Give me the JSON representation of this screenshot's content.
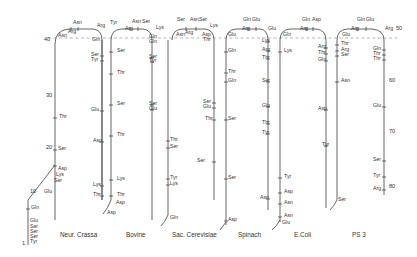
{
  "figure": {
    "reference_line": "dashed"
  },
  "residue_numbers": [
    {
      "label": "1",
      "x": 22,
      "y": 245
    },
    {
      "label": "10",
      "x": 30,
      "y": 193
    },
    {
      "label": "20",
      "x": 46,
      "y": 149
    },
    {
      "label": "30",
      "x": 46,
      "y": 97
    },
    {
      "label": "40",
      "x": 44,
      "y": 41
    },
    {
      "label": "50",
      "x": 396,
      "y": 30
    },
    {
      "label": "60",
      "x": 389,
      "y": 82
    },
    {
      "label": "70",
      "x": 389,
      "y": 133
    },
    {
      "label": "80",
      "x": 389,
      "y": 188
    }
  ],
  "organisms": [
    {
      "name": "Neur. Crassa",
      "caption_x": 60,
      "caption_y": 237
    },
    {
      "name": "Bovine",
      "caption_x": 126,
      "caption_y": 237
    },
    {
      "name": "Sac. Cerevisiae",
      "caption_x": 172,
      "caption_y": 237
    },
    {
      "name": "Spinach",
      "caption_x": 238,
      "caption_y": 237
    },
    {
      "name": "E.Coli",
      "caption_x": 294,
      "caption_y": 237
    },
    {
      "name": "PS 3",
      "caption_x": 352,
      "caption_y": 237
    }
  ],
  "labels": {
    "neur": [
      {
        "t": "Asn",
        "x": 73,
        "y": 24
      },
      {
        "t": "Arg",
        "x": 68,
        "y": 33
      },
      {
        "t": "Arg",
        "x": 97,
        "y": 27
      },
      {
        "t": "Asn",
        "x": 58,
        "y": 37
      },
      {
        "t": "Gln",
        "x": 92,
        "y": 41
      },
      {
        "t": "Ser",
        "x": 91,
        "y": 56
      },
      {
        "t": "Tyr",
        "x": 91,
        "y": 61
      },
      {
        "t": "Thr",
        "x": 59,
        "y": 118
      },
      {
        "t": "Glu",
        "x": 91,
        "y": 111
      },
      {
        "t": "Ser",
        "x": 58,
        "y": 150
      },
      {
        "t": "Asp",
        "x": 58,
        "y": 170
      },
      {
        "t": "Lys",
        "x": 56,
        "y": 176
      },
      {
        "t": "Ser",
        "x": 54,
        "y": 182
      },
      {
        "t": "Glu",
        "x": 44,
        "y": 193
      },
      {
        "t": "Gln",
        "x": 31,
        "y": 209
      },
      {
        "t": "Glu",
        "x": 30,
        "y": 222
      },
      {
        "t": "Ser",
        "x": 30,
        "y": 228
      },
      {
        "t": "Ser",
        "x": 30,
        "y": 233
      },
      {
        "t": "Ser",
        "x": 30,
        "y": 238
      },
      {
        "t": "Tyr",
        "x": 30,
        "y": 243
      }
    ],
    "bovine": [
      {
        "t": "Tyr",
        "x": 110,
        "y": 24
      },
      {
        "t": "Arg",
        "x": 125,
        "y": 30
      },
      {
        "t": "Asn",
        "x": 132,
        "y": 23
      },
      {
        "t": "Ser",
        "x": 142,
        "y": 23
      },
      {
        "t": "Ser",
        "x": 117,
        "y": 52
      },
      {
        "t": "Thr",
        "x": 117,
        "y": 74
      },
      {
        "t": "Ser",
        "x": 117,
        "y": 105
      },
      {
        "t": "Asp",
        "x": 93,
        "y": 142
      },
      {
        "t": "Thr",
        "x": 117,
        "y": 136
      },
      {
        "t": "Lys",
        "x": 93,
        "y": 186
      },
      {
        "t": "Lys",
        "x": 117,
        "y": 180
      },
      {
        "t": "Thr",
        "x": 93,
        "y": 196
      },
      {
        "t": "Thr",
        "x": 117,
        "y": 196
      },
      {
        "t": "Asp",
        "x": 116,
        "y": 204
      },
      {
        "t": "Asp",
        "x": 107,
        "y": 214
      }
    ],
    "sac": [
      {
        "t": "Lys",
        "x": 156,
        "y": 29
      },
      {
        "t": "Gln",
        "x": 149,
        "y": 38
      },
      {
        "t": "Gln",
        "x": 149,
        "y": 43
      },
      {
        "t": "Ser",
        "x": 149,
        "y": 58
      },
      {
        "t": "Tyr",
        "x": 149,
        "y": 62
      },
      {
        "t": "Ser",
        "x": 149,
        "y": 105
      },
      {
        "t": "Glu",
        "x": 149,
        "y": 110
      },
      {
        "t": "Thr",
        "x": 170,
        "y": 141
      },
      {
        "t": "Ser",
        "x": 170,
        "y": 148
      },
      {
        "t": "Tyr",
        "x": 170,
        "y": 179
      },
      {
        "t": "Lys",
        "x": 170,
        "y": 185
      },
      {
        "t": "Gln",
        "x": 170,
        "y": 219
      }
    ],
    "spinach": [
      {
        "t": "Ser",
        "x": 177,
        "y": 21
      },
      {
        "t": "Asn",
        "x": 190,
        "y": 21
      },
      {
        "t": "Ser",
        "x": 199,
        "y": 21
      },
      {
        "t": "Lys",
        "x": 210,
        "y": 27
      },
      {
        "t": "Asn",
        "x": 176,
        "y": 36
      },
      {
        "t": "Arg",
        "x": 185,
        "y": 34
      },
      {
        "t": "Asp",
        "x": 202,
        "y": 36
      },
      {
        "t": "Thr",
        "x": 203,
        "y": 41
      },
      {
        "t": "Ser",
        "x": 203,
        "y": 103
      },
      {
        "t": "Glu",
        "x": 203,
        "y": 108
      },
      {
        "t": "Thr",
        "x": 205,
        "y": 120
      },
      {
        "t": "Ser",
        "x": 197,
        "y": 162
      }
    ],
    "spinach_b": [
      {
        "t": "Gln",
        "x": 228,
        "y": 52
      },
      {
        "t": "Thr",
        "x": 228,
        "y": 73
      },
      {
        "t": "Gln",
        "x": 228,
        "y": 82
      },
      {
        "t": "Ser",
        "x": 228,
        "y": 120
      },
      {
        "t": "Ser",
        "x": 228,
        "y": 179
      },
      {
        "t": "Asp",
        "x": 228,
        "y": 221
      }
    ],
    "ecoli_a": [
      {
        "t": "Gln",
        "x": 243,
        "y": 21
      },
      {
        "t": "Glu",
        "x": 252,
        "y": 21
      },
      {
        "t": "Arg",
        "x": 242,
        "y": 30
      },
      {
        "t": "Glu",
        "x": 228,
        "y": 36
      },
      {
        "t": "Glu",
        "x": 268,
        "y": 30
      },
      {
        "t": "Lys",
        "x": 262,
        "y": 42
      },
      {
        "t": "Arg",
        "x": 262,
        "y": 51
      },
      {
        "t": "Thr",
        "x": 262,
        "y": 59
      },
      {
        "t": "Ser",
        "x": 262,
        "y": 82
      },
      {
        "t": "Glu",
        "x": 262,
        "y": 107
      },
      {
        "t": "Thr",
        "x": 262,
        "y": 124
      },
      {
        "t": "Tyr",
        "x": 262,
        "y": 134
      },
      {
        "t": "Asn",
        "x": 260,
        "y": 199
      }
    ],
    "ecoli_b": [
      {
        "t": "Gln",
        "x": 302,
        "y": 21
      },
      {
        "t": "Asp",
        "x": 312,
        "y": 21
      },
      {
        "t": "Arg",
        "x": 300,
        "y": 30
      },
      {
        "t": "Gln",
        "x": 283,
        "y": 36
      },
      {
        "t": "Lys",
        "x": 284,
        "y": 52
      },
      {
        "t": "Arg",
        "x": 318,
        "y": 48
      },
      {
        "t": "Thr",
        "x": 318,
        "y": 54
      },
      {
        "t": "Gln",
        "x": 318,
        "y": 61
      },
      {
        "t": "Asp",
        "x": 318,
        "y": 110
      },
      {
        "t": "Tyr",
        "x": 322,
        "y": 146
      },
      {
        "t": "Tyr",
        "x": 284,
        "y": 178
      },
      {
        "t": "Asp",
        "x": 284,
        "y": 193
      },
      {
        "t": "Asn",
        "x": 284,
        "y": 204
      },
      {
        "t": "Asn",
        "x": 284,
        "y": 217
      },
      {
        "t": "Glu",
        "x": 282,
        "y": 224
      }
    ],
    "ps3": [
      {
        "t": "Gln",
        "x": 357,
        "y": 21
      },
      {
        "t": "Glu",
        "x": 366,
        "y": 21
      },
      {
        "t": "Arg",
        "x": 351,
        "y": 30
      },
      {
        "t": "Glu",
        "x": 342,
        "y": 36
      },
      {
        "t": "Arg",
        "x": 385,
        "y": 30
      },
      {
        "t": "Thr",
        "x": 341,
        "y": 45
      },
      {
        "t": "Arg",
        "x": 341,
        "y": 51
      },
      {
        "t": "Ser",
        "x": 341,
        "y": 56
      },
      {
        "t": "Asn",
        "x": 341,
        "y": 82
      },
      {
        "t": "Ser",
        "x": 338,
        "y": 201
      },
      {
        "t": "Gln",
        "x": 373,
        "y": 50
      },
      {
        "t": "Thr",
        "x": 373,
        "y": 55
      },
      {
        "t": "Thr",
        "x": 373,
        "y": 60
      },
      {
        "t": "Glu",
        "x": 373,
        "y": 107
      },
      {
        "t": "Ser",
        "x": 373,
        "y": 161
      },
      {
        "t": "Tyr",
        "x": 373,
        "y": 177
      },
      {
        "t": "Arg",
        "x": 373,
        "y": 190
      }
    ]
  }
}
